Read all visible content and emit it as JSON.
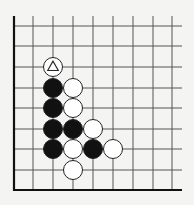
{
  "diagram": {
    "type": "go-board-corner",
    "background": "#f4f4f2",
    "line_color": "#555555",
    "edge_color": "#111111",
    "black_stone_color": "#111111",
    "white_stone_color": "#ffffff",
    "columns_x": [
      14,
      33,
      53,
      73,
      93,
      113,
      133,
      153,
      172
    ],
    "rows_y": [
      26,
      46,
      67,
      88,
      108,
      129,
      149,
      170,
      190
    ],
    "grid_extent": {
      "top": 16,
      "right": 182
    },
    "thick_edges": [
      "left",
      "bottom"
    ],
    "stone_radius": 9.5,
    "stones": [
      {
        "color": "white",
        "col": 2,
        "row": 2,
        "marker": "triangle"
      },
      {
        "color": "black",
        "col": 2,
        "row": 3
      },
      {
        "color": "white",
        "col": 3,
        "row": 3
      },
      {
        "color": "black",
        "col": 2,
        "row": 4
      },
      {
        "color": "white",
        "col": 3,
        "row": 4
      },
      {
        "color": "black",
        "col": 2,
        "row": 5
      },
      {
        "color": "black",
        "col": 3,
        "row": 5
      },
      {
        "color": "white",
        "col": 4,
        "row": 5
      },
      {
        "color": "black",
        "col": 2,
        "row": 6
      },
      {
        "color": "white",
        "col": 3,
        "row": 6
      },
      {
        "color": "black",
        "col": 4,
        "row": 6
      },
      {
        "color": "white",
        "col": 5,
        "row": 6
      },
      {
        "color": "white",
        "col": 3,
        "row": 7
      }
    ]
  }
}
